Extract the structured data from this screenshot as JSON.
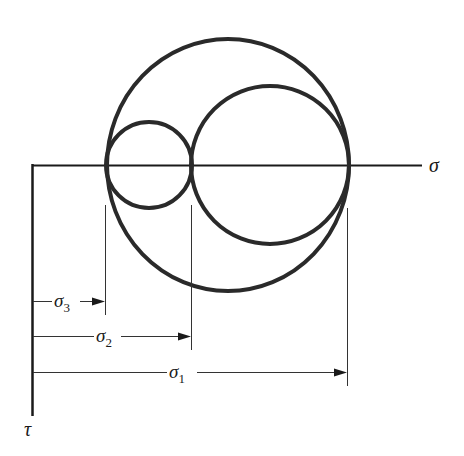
{
  "diagram": {
    "axes": {
      "horizontal_label": "σ",
      "vertical_label": "τ"
    },
    "circles": [
      {
        "name": "large",
        "from": "σ3",
        "to": "σ1"
      },
      {
        "name": "small",
        "from": "σ3",
        "to": "σ2"
      },
      {
        "name": "medium",
        "from": "σ2",
        "to": "σ1"
      }
    ],
    "dimensions": [
      {
        "symbol": "σ",
        "subscript": "3"
      },
      {
        "symbol": "σ",
        "subscript": "2"
      },
      {
        "symbol": "σ",
        "subscript": "1"
      }
    ],
    "colors": {
      "stroke": "#2a2a2a",
      "background": "#ffffff"
    }
  }
}
